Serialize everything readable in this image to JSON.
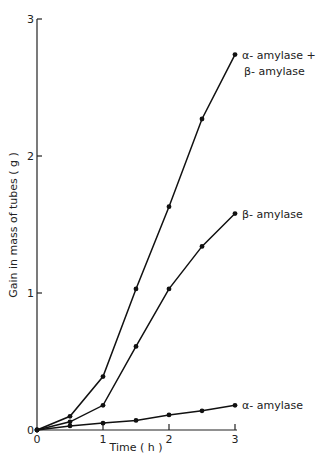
{
  "chart_data": {
    "type": "line",
    "title": "",
    "xlabel": "Time ( h )",
    "ylabel": "Gain in mass of tubes ( g )",
    "xlim": [
      0,
      3
    ],
    "ylim": [
      0,
      3
    ],
    "x_ticks": [
      "0",
      "1",
      "2",
      "3"
    ],
    "y_ticks": [
      "0",
      "1",
      "2",
      "3"
    ],
    "grid": false,
    "legend_position": "inline labels at line ends",
    "x": [
      0,
      0.5,
      1,
      1.5,
      2,
      2.5,
      3
    ],
    "series": [
      {
        "name": "α-amylase + β-amylase",
        "label_lines": [
          "α- amylase +",
          "β- amylase"
        ],
        "values": [
          0,
          0.1,
          0.39,
          1.03,
          1.63,
          2.27,
          2.74
        ]
      },
      {
        "name": "β-amylase",
        "label_lines": [
          "β- amylase"
        ],
        "values": [
          0,
          0.06,
          0.18,
          0.61,
          1.03,
          1.34,
          1.58
        ]
      },
      {
        "name": "α-amylase",
        "label_lines": [
          "α- amylase"
        ],
        "values": [
          0,
          0.03,
          0.05,
          0.07,
          0.11,
          0.14,
          0.18
        ]
      }
    ]
  }
}
